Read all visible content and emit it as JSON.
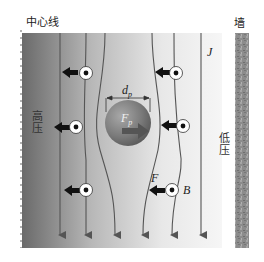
{
  "labels": {
    "centerline": "中心线",
    "wall": "墙",
    "high_pressure": "高压",
    "low_pressure": "低压",
    "current_density": "J",
    "particle_diameter": "d",
    "particle_diameter_sub": "p",
    "particle_force": "F",
    "particle_force_sub": "p",
    "flow_force": "F",
    "magnetic_field": "B"
  },
  "colors": {
    "gradient_dark": "#6e6e6e",
    "gradient_light": "#f4f4f4",
    "line": "#555555",
    "arrow_fill": "#111111",
    "particle_dark": "#5a5a5a",
    "particle_light": "#9a9a9a",
    "wall": "#8a8a8a"
  }
}
